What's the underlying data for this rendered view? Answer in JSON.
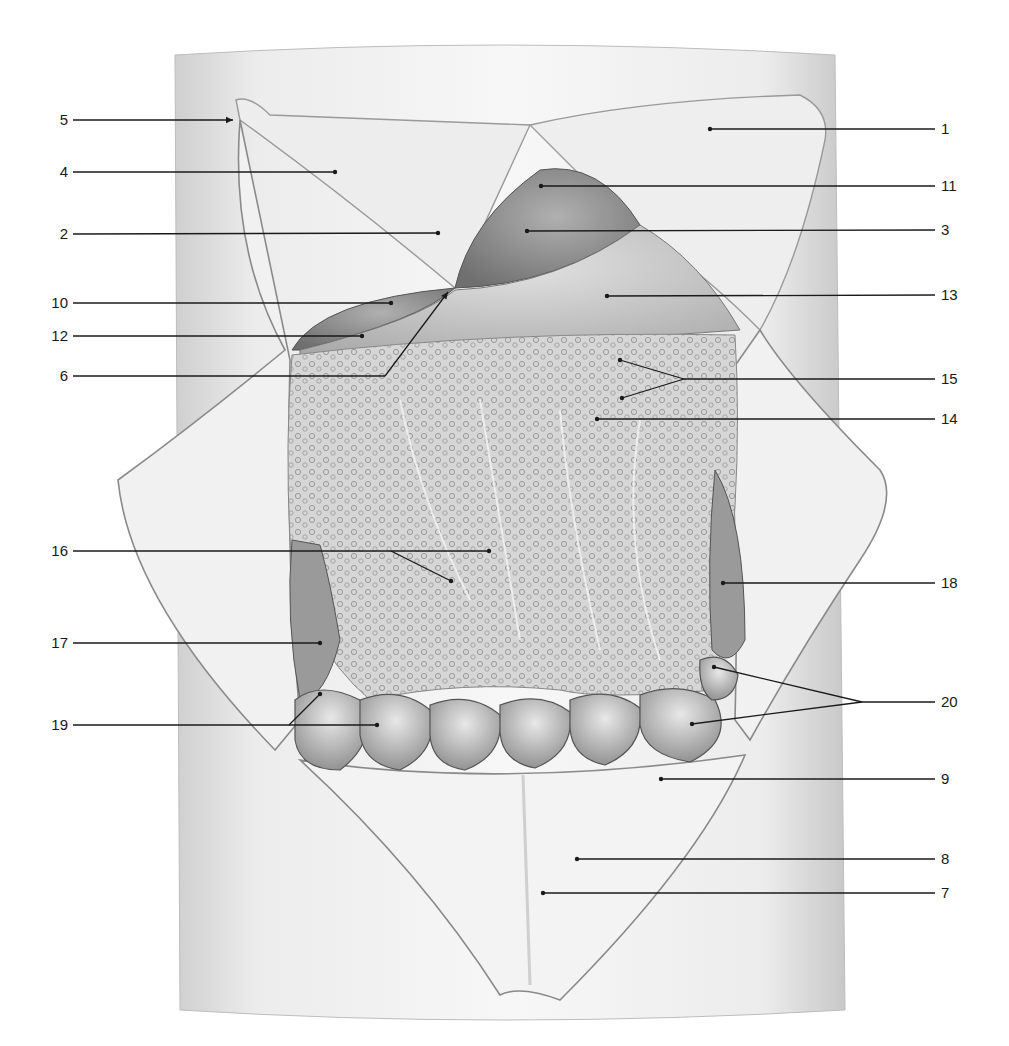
{
  "figure": {
    "type": "anatomical-illustration",
    "colors": {
      "ink": "#1a1a1a",
      "skin": "#e4e4e4",
      "flap": "#efefef",
      "organ_dark": "#8a8a8a",
      "organ_mid": "#b5b5b5",
      "omentum": "#cfcfcf"
    }
  },
  "labels": [
    {
      "num": "5",
      "side": "left",
      "y": 120,
      "tip": [
        233,
        120
      ],
      "arrow": true
    },
    {
      "num": "4",
      "side": "left",
      "y": 172,
      "tip": [
        335,
        172
      ]
    },
    {
      "num": "2",
      "side": "left",
      "y": 234,
      "tip": [
        438,
        233
      ]
    },
    {
      "num": "10",
      "side": "left",
      "y": 303,
      "tip": [
        391,
        303
      ]
    },
    {
      "num": "12",
      "side": "left",
      "y": 336,
      "tip": [
        362,
        336
      ]
    },
    {
      "num": "6",
      "side": "left",
      "y": 376,
      "bend": [
        385,
        376
      ],
      "tip": [
        448,
        292
      ],
      "arrow": true
    },
    {
      "num": "16",
      "side": "left",
      "y": 551,
      "tip": [
        489,
        551
      ],
      "branches": [
        [
          391,
          551,
          451,
          581
        ]
      ]
    },
    {
      "num": "17",
      "side": "left",
      "y": 643,
      "tip": [
        320,
        643
      ]
    },
    {
      "num": "19",
      "side": "left",
      "y": 725,
      "tip": [
        377,
        725
      ],
      "branches": [
        [
          289,
          725,
          320,
          694
        ]
      ]
    },
    {
      "num": "1",
      "side": "right",
      "y": 129,
      "tip": [
        710,
        129
      ]
    },
    {
      "num": "11",
      "side": "right",
      "y": 186,
      "tip": [
        541,
        186
      ]
    },
    {
      "num": "3",
      "side": "right",
      "y": 230,
      "tip": [
        527,
        231
      ]
    },
    {
      "num": "13",
      "side": "right",
      "y": 295,
      "tip": [
        607,
        296
      ]
    },
    {
      "num": "15",
      "side": "right",
      "y": 379,
      "split": [
        684,
        379
      ],
      "tips": [
        [
          620,
          360
        ],
        [
          622,
          398
        ]
      ]
    },
    {
      "num": "14",
      "side": "right",
      "y": 419,
      "tip": [
        597,
        419
      ]
    },
    {
      "num": "18",
      "side": "right",
      "y": 583,
      "tip": [
        723,
        583
      ]
    },
    {
      "num": "20",
      "side": "right",
      "y": 702,
      "split": [
        862,
        702
      ],
      "tips": [
        [
          714,
          667
        ],
        [
          692,
          724
        ]
      ]
    },
    {
      "num": "9",
      "side": "right",
      "y": 779,
      "tip": [
        661,
        779
      ]
    },
    {
      "num": "8",
      "side": "right",
      "y": 859,
      "tip": [
        577,
        859
      ]
    },
    {
      "num": "7",
      "side": "right",
      "y": 893,
      "tip": [
        543,
        893
      ]
    }
  ],
  "layout": {
    "left_label_x": 68,
    "left_line_start": 73,
    "right_line_end": 935,
    "right_label_x": 941
  }
}
